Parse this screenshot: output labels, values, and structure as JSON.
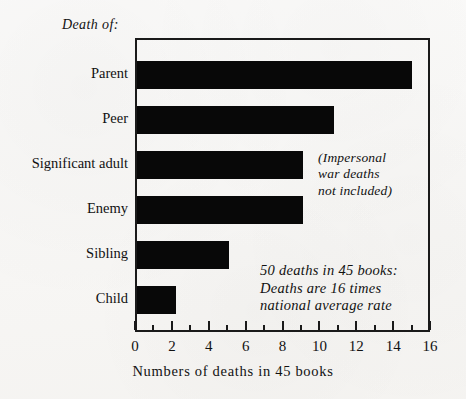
{
  "caption": {
    "death_of": "Death of:"
  },
  "chart_data": {
    "type": "bar",
    "orientation": "horizontal",
    "title": "",
    "subtitle": "",
    "categories": [
      "Parent",
      "Peer",
      "Significant adult",
      "Enemy",
      "Sibling",
      "Child"
    ],
    "values": [
      14.9,
      10.7,
      9,
      9,
      5,
      2.1
    ],
    "xlabel": "Numbers of deaths in 45 books",
    "ylabel": "Death of:",
    "xlim": [
      0,
      16
    ],
    "xticks": [
      0,
      2,
      4,
      6,
      8,
      10,
      12,
      14,
      16
    ],
    "xtick_labels": [
      "0",
      "2",
      "4",
      "6",
      "8",
      "10",
      "12",
      "14",
      "16"
    ],
    "minor_xticks": [
      1,
      3,
      5,
      7,
      9,
      11,
      13,
      15
    ],
    "grid": false,
    "legend": "none",
    "bar_color": "#080808",
    "annotations": [
      {
        "name": "war-deaths-note",
        "lines": [
          "(Impersonal",
          "war deaths",
          "not included)"
        ]
      },
      {
        "name": "deaths-rate-note",
        "lines": [
          "50 deaths in 45 books:",
          "Deaths are 16 times",
          "national average rate"
        ]
      }
    ]
  },
  "colors": {
    "paper": "#f6f5f3",
    "ink": "#111111",
    "bar": "#080808",
    "frame": "#1a1a1a"
  }
}
